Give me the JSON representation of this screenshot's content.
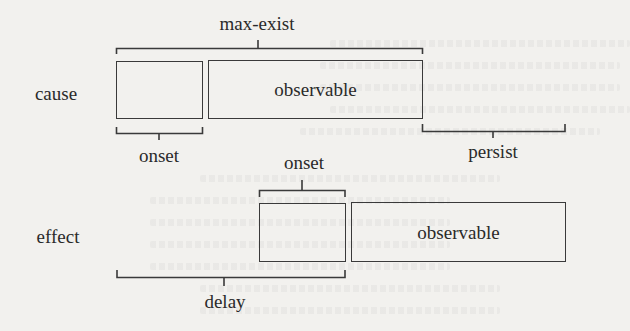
{
  "diagram": {
    "title": "",
    "rows": [
      {
        "label": "cause",
        "segments": [
          {
            "label": "",
            "role": "onset"
          },
          {
            "label": "observable",
            "role": "observable"
          }
        ]
      },
      {
        "label": "effect",
        "segments": [
          {
            "label": "",
            "role": "onset"
          },
          {
            "label": "observable",
            "role": "observable"
          }
        ]
      }
    ],
    "brackets": {
      "max_exist": "max-exist",
      "cause_onset": "onset",
      "persist": "persist",
      "effect_onset": "onset",
      "delay": "delay"
    },
    "colors": {
      "ink": "#2a2a2a",
      "line": "#3a3a3a",
      "paper": "#f2f1ee"
    }
  }
}
